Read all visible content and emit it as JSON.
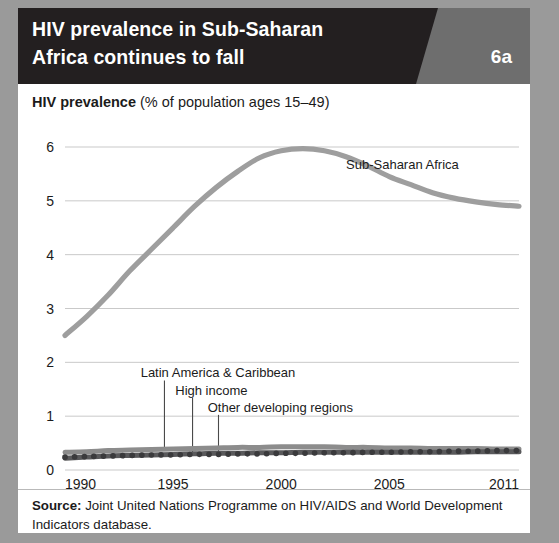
{
  "figure": {
    "title": "HIV prevalence in Sub-Saharan\nAfrica continues to fall",
    "number": "6a",
    "subtitle_bold": "HIV prevalence",
    "subtitle_rest": " (% of population ages 15–49)",
    "source_bold": "Source:",
    "source_rest": " Joint United Nations Programme on HIV/AIDS and World Development Indicators database."
  },
  "colors": {
    "header_black": "#231f20",
    "header_gray": "#6e6e6e",
    "page_background": "#9a9a9a",
    "card_background": "#ffffff",
    "grid": "#c9c9c9",
    "series_ssa": "#9e9e9e",
    "series_other_developing": "#8c8c8c",
    "series_latin_america": "#59595b",
    "series_high_income": "#3a3a3c",
    "text": "#1b1b1b"
  },
  "chart_data": {
    "type": "line",
    "title": "HIV prevalence in Sub-Saharan Africa continues to fall",
    "subtitle": "HIV prevalence (% of population ages 15–49)",
    "xlabel": "",
    "ylabel": "HIV prevalence (% of population ages 15–49)",
    "xlim": [
      1990,
      2011
    ],
    "ylim": [
      0,
      6
    ],
    "yticks": [
      0,
      1,
      2,
      3,
      4,
      5,
      6
    ],
    "ytick_labels": [
      "0",
      "1",
      "2",
      "3",
      "4",
      "5",
      "6"
    ],
    "xticks": [
      1990,
      1995,
      2000,
      2005,
      2011
    ],
    "xtick_labels": [
      "1990",
      "1995",
      "2000",
      "2005",
      "2011"
    ],
    "grid": "horizontal",
    "legend": "inline-annotations",
    "x": [
      1990,
      1991,
      1992,
      1993,
      1994,
      1995,
      1996,
      1997,
      1998,
      1999,
      2000,
      2001,
      2002,
      2003,
      2004,
      2005,
      2006,
      2007,
      2008,
      2009,
      2010,
      2011
    ],
    "series": [
      {
        "name": "Sub-Saharan Africa",
        "style": "solid",
        "color": "#9e9e9e",
        "label_x": 2003,
        "label_y": 5.6,
        "values": [
          2.5,
          2.85,
          3.25,
          3.7,
          4.1,
          4.5,
          4.9,
          5.25,
          5.55,
          5.8,
          5.93,
          5.97,
          5.93,
          5.82,
          5.65,
          5.45,
          5.3,
          5.15,
          5.05,
          4.98,
          4.93,
          4.9
        ]
      },
      {
        "name": "Other developing regions",
        "style": "solid",
        "color": "#8c8c8c",
        "label_x": 1996.6,
        "label_y": 1.08,
        "leader_to_x": 1997.1,
        "leader_to_y": 0.3,
        "values": [
          0.33,
          0.34,
          0.36,
          0.37,
          0.38,
          0.39,
          0.4,
          0.41,
          0.42,
          0.42,
          0.43,
          0.43,
          0.43,
          0.42,
          0.42,
          0.41,
          0.41,
          0.4,
          0.4,
          0.4,
          0.39,
          0.39
        ]
      },
      {
        "name": "Latin America & Caribbean",
        "style": "solid",
        "color": "#59595b",
        "label_x": 1993.5,
        "label_y": 1.72,
        "leader_to_x": 1994.6,
        "leader_to_y": 0.38,
        "values": [
          0.22,
          0.24,
          0.26,
          0.27,
          0.28,
          0.29,
          0.3,
          0.31,
          0.31,
          0.32,
          0.32,
          0.33,
          0.33,
          0.33,
          0.33,
          0.33,
          0.33,
          0.33,
          0.33,
          0.34,
          0.34,
          0.34
        ]
      },
      {
        "name": "High income",
        "style": "dotted",
        "color": "#3a3a3c",
        "label_x": 1995.1,
        "label_y": 1.4,
        "leader_to_x": 1995.9,
        "leader_to_y": 0.33,
        "values": [
          0.24,
          0.25,
          0.26,
          0.27,
          0.28,
          0.28,
          0.29,
          0.29,
          0.3,
          0.3,
          0.31,
          0.31,
          0.32,
          0.32,
          0.33,
          0.33,
          0.34,
          0.34,
          0.35,
          0.35,
          0.36,
          0.36
        ]
      }
    ]
  }
}
